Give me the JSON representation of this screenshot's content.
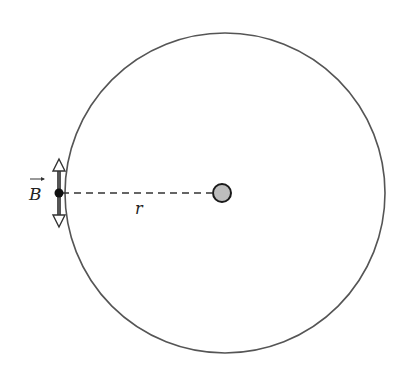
{
  "diagram": {
    "loop": {
      "cx": 225,
      "cy": 193,
      "r": 160,
      "stroke": "#555555"
    },
    "center_wire": {
      "cx": 222,
      "cy": 193,
      "r": 9,
      "fill": "#bdbdbd",
      "stroke": "#1a1a1a"
    },
    "field_point": {
      "x": 59,
      "y": 193
    },
    "field_vector": {
      "label": "B",
      "top_y": 160,
      "bottom_y": 226,
      "color": "#555555"
    },
    "radius_label": "r"
  }
}
